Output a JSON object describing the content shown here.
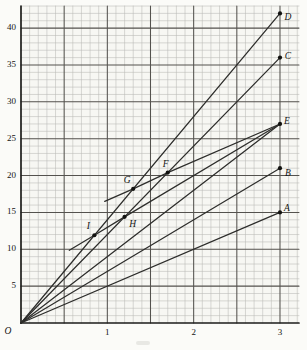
{
  "figure": {
    "background": "#f7f7f3",
    "grid_minor_color": "#b9b9b5",
    "grid_major_color": "#54524e",
    "axis_color": "#1d1d1b",
    "line_color": "#2d2d2b",
    "point_color": "#121210",
    "label_color": "#151513"
  },
  "chart_data": {
    "type": "line",
    "title": "",
    "xlabel": "",
    "ylabel": "",
    "xlim": [
      0,
      3.22
    ],
    "ylim": [
      0,
      43
    ],
    "grid": {
      "x_minor_step": 0.1,
      "x_major_step": 0.5,
      "y_minor_step": 1,
      "y_major_step": 5,
      "grid_on": true
    },
    "origin_label": "O",
    "x_ticks": [
      {
        "value": 1,
        "label": "1"
      },
      {
        "value": 2,
        "label": "2"
      },
      {
        "value": 3,
        "label": "3"
      }
    ],
    "y_ticks": [
      {
        "value": 5,
        "label": "5"
      },
      {
        "value": 10,
        "label": "10"
      },
      {
        "value": 15,
        "label": "15"
      },
      {
        "value": 20,
        "label": "20"
      },
      {
        "value": 25,
        "label": "25"
      },
      {
        "value": 30,
        "label": "30"
      },
      {
        "value": 35,
        "label": "35"
      },
      {
        "value": 40,
        "label": "40"
      }
    ],
    "series": [
      {
        "name": "ray-OD",
        "slope": 14,
        "points": [
          [
            0,
            0
          ],
          [
            3,
            42
          ]
        ]
      },
      {
        "name": "ray-OC",
        "slope": 12,
        "points": [
          [
            0,
            0
          ],
          [
            3,
            36
          ]
        ]
      },
      {
        "name": "ray-OE",
        "slope": 9,
        "points": [
          [
            0,
            0
          ],
          [
            3,
            27
          ]
        ]
      },
      {
        "name": "ray-OB",
        "slope": 7,
        "points": [
          [
            0,
            0
          ],
          [
            3,
            21
          ]
        ]
      },
      {
        "name": "ray-OA",
        "slope": 5,
        "points": [
          [
            0,
            0
          ],
          [
            3,
            15
          ]
        ]
      },
      {
        "name": "chord-IHE",
        "points": [
          [
            0.56,
            9.86
          ],
          [
            0.85,
            11.9
          ],
          [
            1.2,
            14.4
          ],
          [
            3,
            27
          ]
        ]
      },
      {
        "name": "chord-GFE",
        "points": [
          [
            0.97,
            16.49
          ],
          [
            1.3,
            18.2
          ],
          [
            1.7,
            20.4
          ],
          [
            3,
            27
          ]
        ]
      }
    ],
    "points": [
      {
        "label": "A",
        "x": 3,
        "y": 15,
        "dx": 7,
        "dy": -4
      },
      {
        "label": "B",
        "x": 3,
        "y": 21,
        "dx": 8,
        "dy": 6
      },
      {
        "label": "C",
        "x": 3,
        "y": 36,
        "dx": 8,
        "dy": -1
      },
      {
        "label": "D",
        "x": 3,
        "y": 42,
        "dx": 8,
        "dy": 4
      },
      {
        "label": "E",
        "x": 3,
        "y": 27,
        "dx": 7,
        "dy": -2
      },
      {
        "label": "F",
        "x": 1.7,
        "y": 20.4,
        "dx": -2,
        "dy": -8
      },
      {
        "label": "G",
        "x": 1.3,
        "y": 18.2,
        "dx": -6,
        "dy": -8
      },
      {
        "label": "H",
        "x": 1.2,
        "y": 14.4,
        "dx": 8,
        "dy": 8
      },
      {
        "label": "I",
        "x": 0.85,
        "y": 11.9,
        "dx": -6,
        "dy": -8
      }
    ]
  }
}
